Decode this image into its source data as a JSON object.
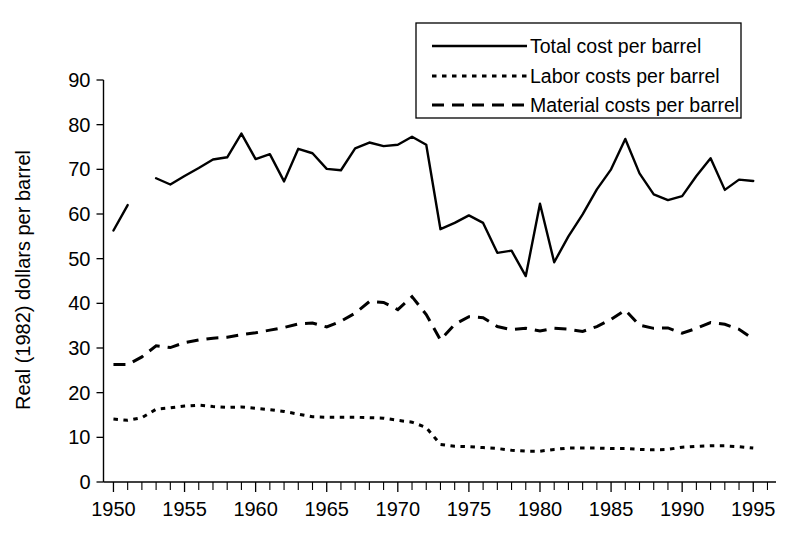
{
  "chart_data": {
    "type": "line",
    "title": "",
    "xlabel": "",
    "ylabel": "Real (1982) dollars per barrel",
    "xlim": [
      1949.3,
      1996.6
    ],
    "ylim": [
      0,
      90
    ],
    "xticks": [
      1950,
      1955,
      1960,
      1965,
      1970,
      1975,
      1980,
      1985,
      1990,
      1995
    ],
    "xtick_labels": [
      "1950",
      "1955",
      "1960",
      "1965",
      "1970",
      "1975",
      "1980",
      "1985",
      "1990",
      "1995"
    ],
    "xtick_minor_step": 1,
    "yticks": [
      0,
      10,
      20,
      30,
      40,
      50,
      60,
      70,
      80,
      90
    ],
    "ytick_labels": [
      "0",
      "10",
      "20",
      "30",
      "40",
      "50",
      "60",
      "70",
      "80",
      "90"
    ],
    "grid": false,
    "legend_position": "top-right",
    "line_color": "#000000",
    "series": [
      {
        "name": "Total cost per barrel",
        "style": "solid",
        "segments": [
          {
            "x": [
              1950,
              1951
            ],
            "values": [
              56.3,
              62.0
            ]
          },
          {
            "x": [
              1953,
              1954,
              1955,
              1956,
              1957,
              1958,
              1959,
              1960,
              1961,
              1962,
              1963,
              1964,
              1965,
              1966,
              1967,
              1968,
              1969,
              1970,
              1971,
              1972,
              1973,
              1974,
              1975,
              1976,
              1977,
              1978,
              1979,
              1980,
              1981,
              1982,
              1983,
              1984,
              1985,
              1986,
              1987,
              1988,
              1989,
              1990,
              1991,
              1992,
              1993,
              1994,
              1995
            ],
            "values": [
              68.0,
              66.6,
              68.5,
              70.3,
              72.2,
              72.7,
              78.0,
              72.3,
              73.4,
              67.3,
              74.6,
              73.6,
              70.1,
              69.8,
              74.7,
              76.0,
              75.2,
              75.5,
              77.3,
              75.5,
              56.6,
              58.0,
              59.7,
              58.0,
              51.3,
              51.8,
              46.1,
              62.3,
              49.2,
              55.0,
              59.9,
              65.5,
              70.0,
              76.8,
              69.1,
              64.4,
              63.1,
              64.0,
              68.5,
              72.5,
              65.4,
              67.7,
              67.4
            ]
          }
        ]
      },
      {
        "name": "Labor costs per barrel",
        "style": "dotted",
        "segments": [
          {
            "x": [
              1950,
              1951,
              1952,
              1953,
              1954,
              1955,
              1956,
              1957,
              1958,
              1959,
              1960,
              1961,
              1962,
              1963,
              1964,
              1965,
              1966,
              1967,
              1968,
              1969,
              1970,
              1971,
              1972,
              1973,
              1974,
              1975,
              1976,
              1977,
              1978,
              1979,
              1980,
              1981,
              1982,
              1983,
              1984,
              1985,
              1986,
              1987,
              1988,
              1989,
              1990,
              1991,
              1992,
              1993,
              1994,
              1995
            ],
            "values": [
              14.1,
              13.8,
              14.4,
              16.3,
              16.6,
              17.0,
              17.2,
              16.9,
              16.7,
              16.8,
              16.5,
              16.2,
              15.8,
              15.2,
              14.6,
              14.5,
              14.5,
              14.5,
              14.4,
              14.3,
              13.8,
              13.4,
              12.2,
              8.4,
              8.0,
              7.9,
              7.7,
              7.5,
              7.1,
              6.9,
              6.9,
              7.3,
              7.6,
              7.6,
              7.6,
              7.5,
              7.5,
              7.3,
              7.2,
              7.3,
              7.8,
              8.0,
              8.1,
              8.1,
              7.9,
              7.6
            ]
          }
        ]
      },
      {
        "name": "Material costs per barrel",
        "style": "dashed",
        "segments": [
          {
            "x": [
              1950,
              1951,
              1952,
              1953,
              1954,
              1955,
              1956,
              1957,
              1958,
              1959,
              1960,
              1961,
              1962,
              1963,
              1964,
              1965,
              1966,
              1967,
              1968,
              1969,
              1970,
              1971,
              1972,
              1973,
              1974,
              1975,
              1976,
              1977,
              1978,
              1979,
              1980,
              1981,
              1982,
              1983,
              1984,
              1985,
              1986,
              1987,
              1988,
              1989,
              1990,
              1991,
              1992,
              1993,
              1994,
              1995
            ],
            "values": [
              26.3,
              26.3,
              28.0,
              30.5,
              30.1,
              31.2,
              31.8,
              32.2,
              32.4,
              33.0,
              33.4,
              34.0,
              34.6,
              35.4,
              35.6,
              34.7,
              36.0,
              37.8,
              40.4,
              40.2,
              38.6,
              41.5,
              37.5,
              31.8,
              35.3,
              37.0,
              36.8,
              34.8,
              34.1,
              34.4,
              33.8,
              34.4,
              34.2,
              33.7,
              34.8,
              36.4,
              38.5,
              35.1,
              34.4,
              34.5,
              33.3,
              34.4,
              35.7,
              35.3,
              34.2,
              32.0
            ]
          }
        ]
      }
    ]
  },
  "legend": {
    "entries": [
      {
        "label": "Total cost per barrel",
        "style": "solid"
      },
      {
        "label": "Labor costs per barrel",
        "style": "dotted"
      },
      {
        "label": "Material costs per barrel",
        "style": "dashed"
      }
    ]
  },
  "axes": {
    "ylabel": "Real (1982) dollars per barrel"
  }
}
